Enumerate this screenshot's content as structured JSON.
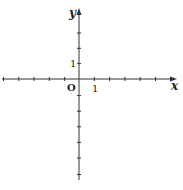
{
  "diagram": {
    "type": "cartesian-coordinate-plane",
    "colors": {
      "axis": "#333333",
      "text": "#222222",
      "background": "#ffffff"
    },
    "x_axis": {
      "label": "x",
      "tick_unit_label": "1",
      "ticks_negative": 5,
      "ticks_positive": 6
    },
    "y_axis": {
      "label": "y",
      "tick_unit_label": "1",
      "ticks_positive": 3,
      "ticks_negative": 6
    },
    "origin_label": "O"
  }
}
